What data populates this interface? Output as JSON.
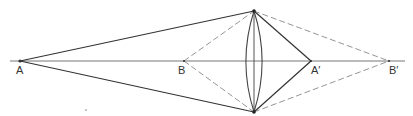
{
  "diagram": {
    "type": "lens-ray-diagram",
    "colors": {
      "background": "#ffffff",
      "solid_ray": "#333333",
      "dashed_ray": "#888888",
      "axis": "#666666",
      "lens": "#444444"
    },
    "axis": {
      "y": 61,
      "x_start": 10,
      "x_end": 405
    },
    "lens": {
      "center_x": 254,
      "top_y": 11,
      "bottom_y": 112,
      "half_width": 12
    },
    "points": [
      {
        "id": "A",
        "label": "A",
        "x": 20,
        "y": 61,
        "label_x": 16,
        "label_y": 74
      },
      {
        "id": "B",
        "label": "B",
        "x": 184,
        "y": 61,
        "label_x": 178,
        "label_y": 74
      },
      {
        "id": "A_prime",
        "label": "A′",
        "x": 311,
        "y": 61,
        "label_x": 311,
        "label_y": 74
      },
      {
        "id": "B_prime",
        "label": "B′",
        "x": 389,
        "y": 61,
        "label_x": 389,
        "label_y": 74
      }
    ],
    "rays": {
      "solid": [
        {
          "from": "A",
          "to": "lens_top"
        },
        {
          "from": "A",
          "to": "lens_bottom"
        },
        {
          "from": "lens_top",
          "to": "A_prime"
        },
        {
          "from": "lens_bottom",
          "to": "A_prime"
        }
      ],
      "dashed": [
        {
          "from": "B",
          "to": "lens_top"
        },
        {
          "from": "B",
          "to": "lens_bottom"
        },
        {
          "from": "lens_top",
          "to": "B_prime"
        },
        {
          "from": "lens_bottom",
          "to": "B_prime"
        }
      ]
    },
    "stray_mark": {
      "x": 86,
      "y": 110
    }
  }
}
